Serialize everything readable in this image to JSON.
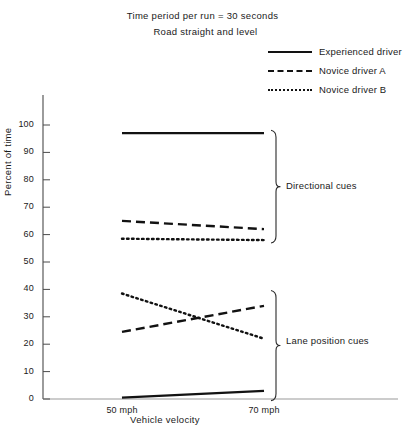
{
  "chart_data": {
    "type": "line",
    "title": "Time period per run = 30 seconds",
    "subtitle": "Road straight and level",
    "xlabel": "Vehicle velocity",
    "ylabel": "Percent of time",
    "categories": [
      "50 mph",
      "70 mph"
    ],
    "x_tick_labels": [
      "50 mph",
      "70 mph"
    ],
    "y_tick_labels": [
      "0",
      "10",
      "20",
      "30",
      "40",
      "50",
      "60",
      "70",
      "80",
      "90",
      "100"
    ],
    "y_ticks": [
      0,
      10,
      20,
      30,
      40,
      50,
      60,
      70,
      80,
      90,
      100
    ],
    "ylim": [
      0,
      100
    ],
    "grid": false,
    "legend_position": "top-right",
    "line_color": "#121212",
    "series": [
      {
        "name": "Experienced driver",
        "group": "Directional cues",
        "style": "solid",
        "values": [
          97,
          97
        ]
      },
      {
        "name": "Novice driver A",
        "group": "Directional cues",
        "style": "dashed",
        "values": [
          65,
          62
        ]
      },
      {
        "name": "Novice driver B",
        "group": "Directional cues",
        "style": "dotted",
        "values": [
          58.5,
          58
        ]
      },
      {
        "name": "Experienced driver",
        "group": "Lane position cues",
        "style": "solid",
        "values": [
          0.5,
          3
        ]
      },
      {
        "name": "Novice driver A",
        "group": "Lane position cues",
        "style": "dashed",
        "values": [
          24.5,
          34
        ]
      },
      {
        "name": "Novice driver B",
        "group": "Lane position cues",
        "style": "dotted",
        "values": [
          38.5,
          22
        ]
      }
    ],
    "annotations": [
      {
        "label": "Directional cues",
        "bracket_range": [
          58,
          97
        ]
      },
      {
        "label": "Lane position cues",
        "bracket_range": [
          0.5,
          38.5
        ]
      }
    ]
  },
  "legend": {
    "items": [
      {
        "label": "Experienced driver",
        "style": "solid"
      },
      {
        "label": "Novice driver A",
        "style": "dashed"
      },
      {
        "label": "Novice driver B",
        "style": "dotted"
      }
    ]
  }
}
